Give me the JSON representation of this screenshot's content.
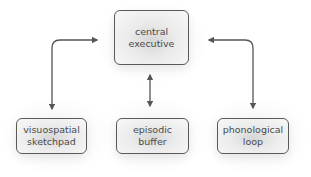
{
  "diagram": {
    "nodes": {
      "central": {
        "label": "central\nexecutive"
      },
      "visuospatial": {
        "label": "visuospatial\nsketchpad"
      },
      "episodic": {
        "label": "episodic\nbuffer"
      },
      "phonological": {
        "label": "phonological\nloop"
      }
    },
    "edges": [
      {
        "from": "central",
        "to": "visuospatial",
        "direction": "bidirectional"
      },
      {
        "from": "central",
        "to": "episodic",
        "direction": "bidirectional"
      },
      {
        "from": "central",
        "to": "phonological",
        "direction": "bidirectional"
      }
    ],
    "colors": {
      "stroke": "#5a5a5a",
      "text": "#4a4a4a",
      "arrow": "#555555"
    }
  }
}
